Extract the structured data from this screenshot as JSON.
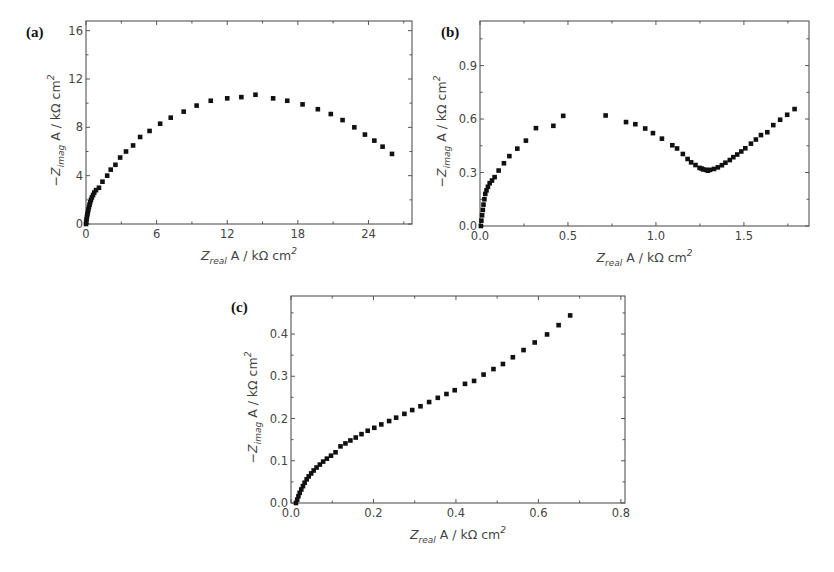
{
  "figure": {
    "panels": [
      "(a)",
      "(b)",
      "(c)"
    ]
  },
  "chart_data": [
    {
      "id": "a",
      "type": "scatter",
      "panel_label": "(a)",
      "title": "",
      "xlabel": "Z_real A / kΩ cm²",
      "ylabel": "−Z_imag A / kΩ cm²",
      "xlim": [
        0,
        27.7
      ],
      "ylim": [
        0,
        16.8
      ],
      "xticks": [
        0,
        6,
        12,
        18,
        24
      ],
      "yticks": [
        0,
        4,
        8,
        12,
        16
      ],
      "xminor": 3,
      "yminor": 2,
      "grid": false,
      "legend": null,
      "marker": "square",
      "box": {
        "left": 86,
        "top": 21,
        "right": 412,
        "bottom": 224
      },
      "series": [
        {
          "name": "impedance",
          "x": [
            0.0,
            0.02,
            0.05,
            0.08,
            0.12,
            0.16,
            0.2,
            0.25,
            0.3,
            0.36,
            0.42,
            0.5,
            0.6,
            0.7,
            0.85,
            1.1,
            1.4,
            1.8,
            2.1,
            2.5,
            2.9,
            3.4,
            4.0,
            4.6,
            5.4,
            6.3,
            7.2,
            8.3,
            9.4,
            10.6,
            12.0,
            13.2,
            14.4,
            15.9,
            17.1,
            18.4,
            19.7,
            20.8,
            21.8,
            22.8,
            23.7,
            24.5,
            25.2,
            26.0
          ],
          "y": [
            0.0,
            0.2,
            0.4,
            0.6,
            0.8,
            1.0,
            1.2,
            1.4,
            1.6,
            1.8,
            2.0,
            2.2,
            2.4,
            2.6,
            2.8,
            3.0,
            3.5,
            4.0,
            4.5,
            4.9,
            5.5,
            6.0,
            6.5,
            7.2,
            7.7,
            8.3,
            8.8,
            9.3,
            9.8,
            10.2,
            10.4,
            10.5,
            10.7,
            10.4,
            10.2,
            9.9,
            9.5,
            9.1,
            8.6,
            8.0,
            7.4,
            6.9,
            6.4,
            5.8
          ]
        }
      ]
    },
    {
      "id": "b",
      "type": "scatter",
      "panel_label": "(b)",
      "title": "",
      "xlabel": "Z_real A / kΩ cm²",
      "ylabel": "−Z_imag A / kΩ cm²",
      "xlim": [
        0,
        1.87
      ],
      "ylim": [
        0,
        1.15
      ],
      "xticks": [
        0.0,
        0.5,
        1.0,
        1.5
      ],
      "yticks": [
        0.0,
        0.3,
        0.6,
        0.9
      ],
      "xminor": 0.25,
      "yminor": 0.15,
      "grid": false,
      "legend": null,
      "marker": "square",
      "box": {
        "left": 480,
        "top": 21,
        "right": 809,
        "bottom": 226
      },
      "series": [
        {
          "name": "impedance",
          "x": [
            0.005,
            0.008,
            0.012,
            0.016,
            0.02,
            0.025,
            0.03,
            0.037,
            0.045,
            0.055,
            0.068,
            0.083,
            0.106,
            0.136,
            0.167,
            0.212,
            0.261,
            0.318,
            0.417,
            0.473,
            0.714,
            0.83,
            0.883,
            0.939,
            0.983,
            1.034,
            1.093,
            1.12,
            1.153,
            1.18,
            1.2,
            1.225,
            1.248,
            1.26,
            1.27,
            1.285,
            1.295,
            1.307,
            1.33,
            1.352,
            1.375,
            1.395,
            1.42,
            1.44,
            1.462,
            1.485,
            1.508,
            1.54,
            1.568,
            1.597,
            1.633,
            1.667,
            1.706,
            1.746,
            1.788
          ],
          "y": [
            0.0,
            0.03,
            0.06,
            0.09,
            0.12,
            0.15,
            0.18,
            0.2,
            0.22,
            0.24,
            0.255,
            0.274,
            0.311,
            0.352,
            0.392,
            0.434,
            0.479,
            0.549,
            0.562,
            0.618,
            0.62,
            0.583,
            0.571,
            0.547,
            0.521,
            0.49,
            0.453,
            0.435,
            0.404,
            0.376,
            0.357,
            0.342,
            0.326,
            0.322,
            0.317,
            0.315,
            0.31,
            0.315,
            0.32,
            0.329,
            0.341,
            0.355,
            0.37,
            0.386,
            0.401,
            0.418,
            0.436,
            0.462,
            0.485,
            0.51,
            0.526,
            0.566,
            0.596,
            0.624,
            0.656
          ]
        }
      ]
    },
    {
      "id": "c",
      "type": "scatter",
      "panel_label": "(c)",
      "title": "",
      "xlabel": "Z_real A / kΩ cm²",
      "ylabel": "−Z_imag A / kΩ cm²",
      "xlim": [
        0,
        0.81
      ],
      "ylim": [
        0,
        0.49
      ],
      "xticks": [
        0.0,
        0.2,
        0.4,
        0.6,
        0.8
      ],
      "yticks": [
        0.0,
        0.1,
        0.2,
        0.3,
        0.4
      ],
      "xminor": 0.1,
      "yminor": 0.05,
      "grid": false,
      "legend": null,
      "marker": "square",
      "box": {
        "left": 291,
        "top": 296,
        "right": 625,
        "bottom": 503
      },
      "series": [
        {
          "name": "impedance",
          "x": [
            0.012,
            0.015,
            0.018,
            0.021,
            0.025,
            0.029,
            0.033,
            0.038,
            0.043,
            0.049,
            0.055,
            0.062,
            0.07,
            0.078,
            0.087,
            0.097,
            0.108,
            0.12,
            0.132,
            0.144,
            0.157,
            0.171,
            0.186,
            0.202,
            0.219,
            0.238,
            0.255,
            0.275,
            0.294,
            0.314,
            0.335,
            0.356,
            0.377,
            0.397,
            0.422,
            0.444,
            0.467,
            0.491,
            0.514,
            0.538,
            0.564,
            0.591,
            0.621,
            0.649,
            0.677
          ],
          "y": [
            0.0,
            0.008,
            0.016,
            0.024,
            0.032,
            0.04,
            0.048,
            0.056,
            0.063,
            0.07,
            0.077,
            0.084,
            0.091,
            0.098,
            0.105,
            0.112,
            0.12,
            0.134,
            0.141,
            0.148,
            0.155,
            0.163,
            0.171,
            0.178,
            0.186,
            0.194,
            0.202,
            0.211,
            0.22,
            0.229,
            0.239,
            0.249,
            0.258,
            0.267,
            0.282,
            0.289,
            0.304,
            0.317,
            0.329,
            0.345,
            0.362,
            0.38,
            0.399,
            0.421,
            0.444
          ]
        }
      ]
    }
  ]
}
